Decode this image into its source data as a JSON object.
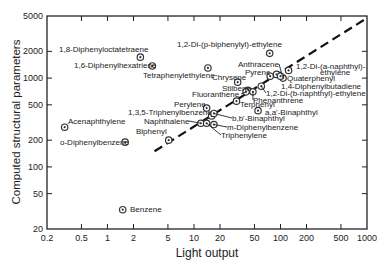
{
  "chart_data": {
    "type": "scatter",
    "title": "",
    "xlabel": "Light output",
    "ylabel": "Computed structural parameters",
    "xscale": "log",
    "yscale": "log",
    "xlim": [
      0.2,
      1000
    ],
    "ylim": [
      20,
      5000
    ],
    "x_ticks": [
      "0.2",
      "0.5",
      "1",
      "2",
      "5",
      "10",
      "20",
      "50",
      "100",
      "200",
      "500",
      "1000"
    ],
    "x_tick_values": [
      0.2,
      0.5,
      1,
      2,
      5,
      10,
      20,
      50,
      100,
      200,
      500,
      1000
    ],
    "y_ticks": [
      "20",
      "50",
      "100",
      "200",
      "500",
      "1000",
      "2000",
      "5000"
    ],
    "y_tick_values": [
      20,
      50,
      100,
      200,
      500,
      1000,
      2000,
      5000
    ],
    "grid": false,
    "legend": null,
    "trend_line": {
      "style": "dashed",
      "from": [
        3.5,
        150
      ],
      "to": [
        950,
        4600
      ]
    },
    "points": [
      {
        "label": "1,8-Diphenyloctatetraene",
        "x": 2.4,
        "y": 1720
      },
      {
        "label": "1,6-Diphenylhexatriene",
        "x": 3.3,
        "y": 1370
      },
      {
        "label": "Tetraphenylethylene",
        "x": 14.5,
        "y": 1300
      },
      {
        "label": "1,2-Di-(p-biphenylyl)-ethylene",
        "x": 75,
        "y": 1900
      },
      {
        "label": "Anthracene",
        "x": 107,
        "y": 1000
      },
      {
        "label": "1,2-Di-(a-naphthyl)-ethylene",
        "x": 124,
        "y": 1220
      },
      {
        "label": "Pyrene",
        "x": 76,
        "y": 1050
      },
      {
        "label": "Quaterphenyl",
        "x": 90,
        "y": 1100
      },
      {
        "label": "1,4-Diphenylbutadiene",
        "x": 100,
        "y": 1050
      },
      {
        "label": "Chrysene",
        "x": 32,
        "y": 900
      },
      {
        "label": "Stilbene",
        "x": 42,
        "y": 730
      },
      {
        "label": "1,2-Di-(b-naphthyl)-ethylene",
        "x": 60,
        "y": 810
      },
      {
        "label": "Phenanthrene",
        "x": 48,
        "y": 700
      },
      {
        "label": "Fluoranthene",
        "x": 40,
        "y": 700
      },
      {
        "label": "Terphenyl",
        "x": 31,
        "y": 550
      },
      {
        "label": "a,a'-Binaphthyl",
        "x": 55,
        "y": 430
      },
      {
        "label": "Perylene",
        "x": 14,
        "y": 460
      },
      {
        "label": "1,3,5-Triphenylbenzene",
        "x": 16,
        "y": 375
      },
      {
        "label": "b,b'-Binaphthyl",
        "x": 17,
        "y": 400
      },
      {
        "label": "m-Diphenylbenzene",
        "x": 17,
        "y": 300
      },
      {
        "label": "Naphthalene",
        "x": 12,
        "y": 310
      },
      {
        "label": "Triphenylene",
        "x": 14,
        "y": 310
      },
      {
        "label": "Biphenyl",
        "x": 5.1,
        "y": 200
      },
      {
        "label": "Acenaphthylene",
        "x": 0.32,
        "y": 280
      },
      {
        "label": "o-Diphenylbenzene",
        "x": 1.6,
        "y": 190
      },
      {
        "label": "Benzene",
        "x": 1.5,
        "y": 33
      }
    ],
    "labels_layout": [
      {
        "text": "1,8-Diphenyloctatetraene",
        "tx": 59,
        "ty": 52,
        "anchor": "start",
        "leader": false
      },
      {
        "text": "1,6-Diphenylhexatriene",
        "tx": 74,
        "ty": 68,
        "anchor": "start",
        "leader": false
      },
      {
        "text": "Tetraphenylethylene",
        "tx": 143,
        "ty": 78,
        "anchor": "start",
        "leader": false
      },
      {
        "text": "1,2-Di-(p-biphenylyl)-ethylene",
        "tx": 177,
        "ty": 47,
        "anchor": "start",
        "leader": false
      },
      {
        "text": "Anthracene",
        "tx": 238,
        "ty": 67,
        "anchor": "start",
        "leader": true
      },
      {
        "text": "1,2-Di-(a-naphthyl)-",
        "tx": 296,
        "ty": 69,
        "anchor": "start",
        "leader": false
      },
      {
        "text": "ethylene",
        "tx": 320,
        "ty": 75,
        "anchor": "start",
        "leader": false
      },
      {
        "text": "Pyrene",
        "tx": 245,
        "ty": 75,
        "anchor": "start",
        "leader": false
      },
      {
        "text": "Quaterphenyl",
        "tx": 287,
        "ty": 81,
        "anchor": "start",
        "leader": false
      },
      {
        "text": "1,4-Diphenylbutadiene",
        "tx": 281,
        "ty": 89,
        "anchor": "start",
        "leader": false
      },
      {
        "text": "Chrysene",
        "tx": 212,
        "ty": 80,
        "anchor": "start",
        "leader": false
      },
      {
        "text": "Stilbene",
        "tx": 222,
        "ty": 91,
        "anchor": "start",
        "leader": false
      },
      {
        "text": "1,2-Di-(b-naphthyl)-ethylene",
        "tx": 266,
        "ty": 96,
        "anchor": "start",
        "leader": true
      },
      {
        "text": "Phenanthrene",
        "tx": 253,
        "ty": 103,
        "anchor": "start",
        "leader": true
      },
      {
        "text": "Fluoranthene",
        "tx": 192,
        "ty": 97,
        "anchor": "start",
        "leader": true
      },
      {
        "text": "Terphenyl",
        "tx": 240,
        "ty": 107,
        "anchor": "start",
        "leader": false
      },
      {
        "text": "a,a'-Binaphthyl",
        "tx": 265,
        "ty": 115,
        "anchor": "start",
        "leader": false
      },
      {
        "text": "Perylene",
        "tx": 174,
        "ty": 107,
        "anchor": "start",
        "leader": false
      },
      {
        "text": "1,3,5-Triphenylbenzene",
        "tx": 128,
        "ty": 115,
        "anchor": "start",
        "leader": false
      },
      {
        "text": "b,b'-Binaphthyl",
        "tx": 232,
        "ty": 121,
        "anchor": "start",
        "leader": true
      },
      {
        "text": "m-Diphenylbenzene",
        "tx": 227,
        "ty": 130,
        "anchor": "start",
        "leader": true
      },
      {
        "text": "Naphthalene",
        "tx": 144,
        "ty": 124,
        "anchor": "start",
        "leader": true
      },
      {
        "text": "Triphenylene",
        "tx": 221,
        "ty": 138,
        "anchor": "start",
        "leader": true
      },
      {
        "text": "Biphenyl",
        "tx": 136,
        "ty": 134,
        "anchor": "start",
        "leader": false
      },
      {
        "text": "Acenaphthylene",
        "tx": 68,
        "ty": 124,
        "anchor": "start",
        "leader": false
      },
      {
        "text": "o-Diphenylbenzene",
        "tx": 60,
        "ty": 145,
        "anchor": "start",
        "leader": false
      },
      {
        "text": "Benzene",
        "tx": 130,
        "ty": 212,
        "anchor": "start",
        "leader": false
      }
    ]
  },
  "colors": {
    "axis": "#222222",
    "marker": "#333333",
    "text": "#222222",
    "background": "#ffffff"
  }
}
